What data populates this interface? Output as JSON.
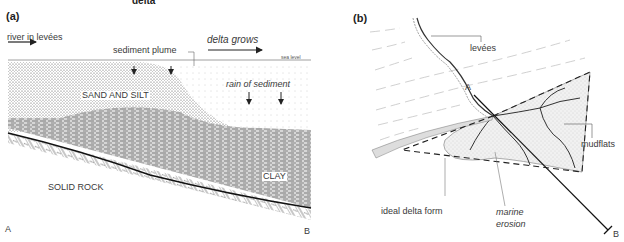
{
  "title_fragment": "delta",
  "panel_a": {
    "label": "(a)",
    "labels": {
      "river": "river in levées",
      "sediment_plume": "sediment plume",
      "delta_grows": "delta grows",
      "sea_level": "sea level",
      "rain": "rain of sediment",
      "sand_silt": "SAND AND SILT",
      "clay": "CLAY",
      "solid_rock": "SOLID ROCK",
      "end_a": "A",
      "end_b": "B"
    }
  },
  "panel_b": {
    "label": "(b)",
    "labels": {
      "levees": "levées",
      "mudflats": "mudflats",
      "ideal_form": "ideal delta form",
      "marine_erosion_1": "marine",
      "marine_erosion_2": "erosion",
      "point_a": "A",
      "point_b": "B"
    }
  }
}
